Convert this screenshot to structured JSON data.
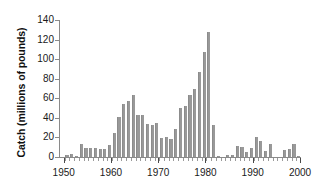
{
  "chart_data": {
    "type": "bar",
    "title": "",
    "xlabel": "",
    "ylabel": "Catch (millions of pounds)",
    "ylim": [
      0,
      140
    ],
    "xlim": [
      1949,
      2000
    ],
    "grid": false,
    "legend": null,
    "bar_color": "#999999",
    "axis_color": "#8a8a8a",
    "ytick_labels": [
      "0",
      "20",
      "40",
      "60",
      "80",
      "100",
      "120",
      "140"
    ],
    "ytick_values": [
      0,
      20,
      40,
      60,
      80,
      100,
      120,
      140
    ],
    "xtick_labels": [
      "1950",
      "1960",
      "1970",
      "1980",
      "1990",
      "2000"
    ],
    "xtick_values": [
      1950,
      1960,
      1970,
      1980,
      1990,
      2000
    ],
    "categories": [
      1950,
      1951,
      1952,
      1953,
      1954,
      1955,
      1956,
      1957,
      1958,
      1959,
      1960,
      1961,
      1962,
      1963,
      1964,
      1965,
      1966,
      1967,
      1968,
      1969,
      1970,
      1971,
      1972,
      1973,
      1974,
      1975,
      1976,
      1977,
      1978,
      1979,
      1980,
      1981,
      1982,
      1983,
      1984,
      1985,
      1986,
      1987,
      1988,
      1989,
      1990,
      1991,
      1992,
      1993,
      1994,
      1995,
      1996,
      1997,
      1998,
      1999
    ],
    "values": [
      2,
      3,
      1,
      13,
      9,
      9,
      9,
      8,
      8,
      12,
      25,
      41,
      54,
      57,
      63,
      43,
      43,
      34,
      33,
      35,
      19,
      20,
      18,
      29,
      50,
      52,
      63,
      70,
      87,
      107,
      128,
      33,
      1,
      0,
      2,
      2,
      11,
      10,
      5,
      9,
      20,
      16,
      6,
      13,
      0,
      0,
      7,
      8,
      13,
      1
    ]
  }
}
